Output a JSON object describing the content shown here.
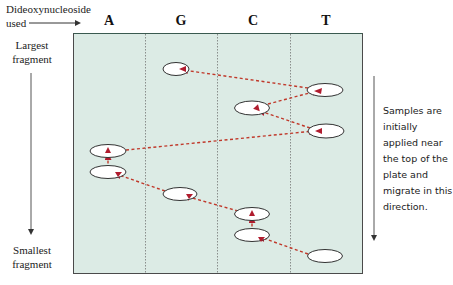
{
  "header": {
    "axis_label_line1": "Dideoxynucleoside",
    "axis_label_line2": "used"
  },
  "lanes": [
    {
      "label": "A",
      "center_x": 109
    },
    {
      "label": "G",
      "center_x": 181
    },
    {
      "label": "C",
      "center_x": 253
    },
    {
      "label": "T",
      "center_x": 326
    }
  ],
  "left_axis": {
    "top_label_line1": "Largest",
    "top_label_line2": "fragment",
    "bottom_label_line1": "Smallest",
    "bottom_label_line2": "fragment"
  },
  "note": {
    "text": "Samples are initially applied near the top of the plate and migrate in this direction."
  },
  "colors": {
    "plate_fill": "#dcebe5",
    "plate_border": "#4a4a4a",
    "dashed_path": "#c0392b",
    "arrowhead": "#b01c2e",
    "band_fill": "#ffffff",
    "band_stroke": "#333333"
  },
  "bands": [
    {
      "lane": "G",
      "cx": 176,
      "cy": 69
    },
    {
      "lane": "T",
      "cx": 325,
      "cy": 90
    },
    {
      "lane": "C",
      "cx": 252,
      "cy": 108
    },
    {
      "lane": "T",
      "cx": 326,
      "cy": 131
    },
    {
      "lane": "A",
      "cx": 108,
      "cy": 151
    },
    {
      "lane": "A",
      "cx": 108,
      "cy": 172
    },
    {
      "lane": "G",
      "cx": 180,
      "cy": 194
    },
    {
      "lane": "C",
      "cx": 252,
      "cy": 214
    },
    {
      "lane": "C",
      "cx": 252,
      "cy": 235
    },
    {
      "lane": "T",
      "cx": 325,
      "cy": 256
    }
  ],
  "sequence_read_order_bottom_to_top": [
    "T",
    "C",
    "C",
    "G",
    "A",
    "A",
    "T",
    "C",
    "T",
    "G"
  ]
}
